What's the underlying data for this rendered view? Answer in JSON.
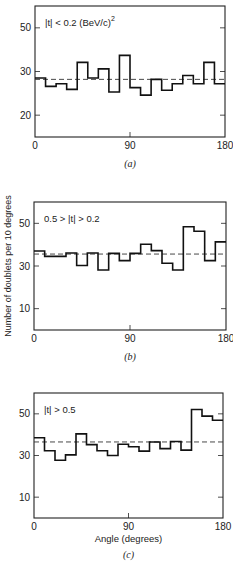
{
  "figure": {
    "ylabel": "Number of doublets per 10 degrees",
    "xlabel": "Angle (degrees)"
  },
  "chart_data": [
    {
      "type": "bar",
      "style": "step-histogram",
      "panel": "(a)",
      "annotation": "|t| < 0.2 (BeV/c)^2",
      "annotation_parts": {
        "main": "|t| < 0.2 (BeV/c)",
        "sup": "2"
      },
      "xlabel": "",
      "ylabel": "Number of doublets per 10 degrees",
      "x_ticks": [
        0,
        90,
        180
      ],
      "y_ticks": [
        {
          "label": "50",
          "value": 40
        },
        {
          "label": "30",
          "value": 30
        },
        {
          "label": "20",
          "value": 20
        }
      ],
      "bin_edges": [
        0,
        10,
        20,
        30,
        40,
        50,
        60,
        70,
        80,
        90,
        100,
        110,
        120,
        130,
        140,
        150,
        160,
        170,
        180
      ],
      "values": [
        28.5,
        26.6,
        27.2,
        25.9,
        32.1,
        28.5,
        30.6,
        25.3,
        33.7,
        26.3,
        24.6,
        28.2,
        25.7,
        27.2,
        29.1,
        27.2,
        32.1,
        27.2
      ],
      "mean_line": 28.2,
      "xlim": [
        0,
        180
      ],
      "ylim": [
        15,
        45
      ],
      "grid": false,
      "box": {
        "left": 35,
        "right": 225,
        "top": 6,
        "bottom": 137
      }
    },
    {
      "type": "bar",
      "style": "step-histogram",
      "panel": "(b)",
      "annotation": "0.5 > |t| > 0.2",
      "annotation_parts": {
        "main": "0.5 > |t| > 0.2",
        "sup": ""
      },
      "xlabel": "",
      "ylabel": "Number of doublets per 10 degrees",
      "x_ticks": [
        0,
        90,
        180
      ],
      "y_ticks": [
        {
          "label": "50",
          "value": 50
        },
        {
          "label": "30",
          "value": 30
        },
        {
          "label": "10",
          "value": 10
        }
      ],
      "bin_edges": [
        0,
        10,
        20,
        30,
        40,
        50,
        60,
        70,
        80,
        90,
        100,
        110,
        120,
        130,
        140,
        150,
        160,
        170,
        180
      ],
      "values": [
        37.0,
        34.5,
        34.5,
        36.1,
        30.2,
        36.1,
        28.1,
        35.9,
        32.5,
        35.9,
        40.2,
        37.2,
        31.3,
        28.1,
        48.4,
        46.3,
        32.5,
        41.3
      ],
      "mean_line": 35.6,
      "xlim": [
        0,
        180
      ],
      "ylim": [
        0,
        60
      ],
      "grid": false,
      "box": {
        "left": 34,
        "right": 226,
        "top": 202,
        "bottom": 330
      }
    },
    {
      "type": "bar",
      "style": "step-histogram",
      "panel": "(c)",
      "annotation": "|t| > 0.5",
      "annotation_parts": {
        "main": "|t| > 0.5",
        "sup": ""
      },
      "xlabel": "Angle (degrees)",
      "ylabel": "Number of doublets per 10 degrees",
      "x_ticks": [
        0,
        90,
        180
      ],
      "y_ticks": [
        {
          "label": "50",
          "value": 50
        },
        {
          "label": "30",
          "value": 30
        },
        {
          "label": "10",
          "value": 10
        }
      ],
      "bin_edges": [
        0,
        10,
        20,
        30,
        40,
        50,
        60,
        70,
        80,
        90,
        100,
        110,
        120,
        130,
        140,
        150,
        160,
        170,
        180
      ],
      "values": [
        38.5,
        32.3,
        27.7,
        30.3,
        40.4,
        35.2,
        32.3,
        30.0,
        35.4,
        34.2,
        32.1,
        36.5,
        33.3,
        36.7,
        32.6,
        52.1,
        48.9,
        46.9
      ],
      "mean_line": 36.5,
      "xlim": [
        0,
        180
      ],
      "ylim": [
        0,
        60
      ],
      "grid": false,
      "box": {
        "left": 34,
        "right": 223,
        "top": 393,
        "bottom": 518
      }
    }
  ]
}
